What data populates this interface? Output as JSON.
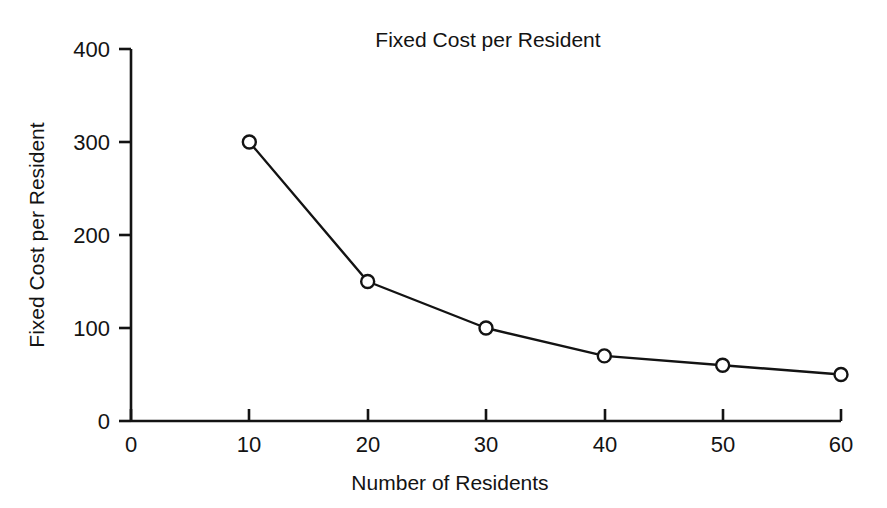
{
  "chart_data": {
    "type": "line",
    "title": "Fixed Cost per Resident",
    "xlabel": "Number of Residents",
    "ylabel": "Fixed Cost per Resident",
    "x": [
      10,
      20,
      30,
      40,
      50,
      60
    ],
    "values": [
      300,
      150,
      100,
      70,
      60,
      50
    ],
    "series": [
      {
        "name": "Fixed Cost per Resident",
        "values": [
          300,
          150,
          100,
          70,
          60,
          50
        ]
      }
    ],
    "xlim": [
      0,
      60
    ],
    "ylim": [
      0,
      400
    ],
    "xticks": [
      0,
      10,
      20,
      30,
      40,
      50,
      60
    ],
    "yticks": [
      0,
      100,
      200,
      300,
      400
    ],
    "xtick_labels": [
      "0",
      "10",
      "20",
      "30",
      "40",
      "50",
      "60"
    ],
    "ytick_labels": [
      "0",
      "100",
      "200",
      "300",
      "400"
    ],
    "grid": false,
    "legend": "none",
    "marker": "open-circle",
    "line_color": "#131313",
    "marker_face_color": "#ffffff",
    "background_color": "#ffffff"
  }
}
